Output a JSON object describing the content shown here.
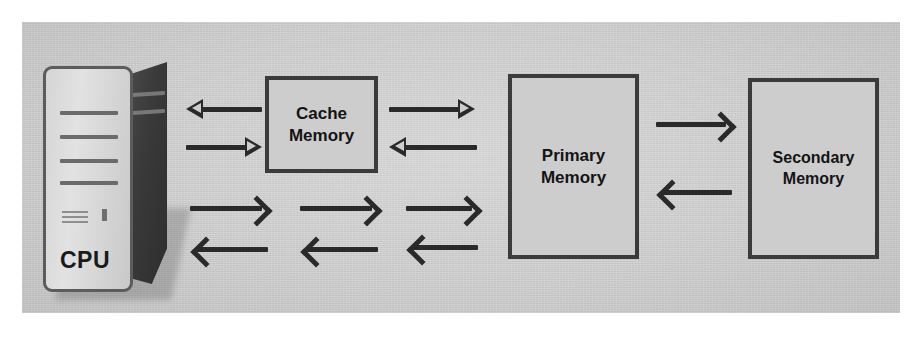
{
  "diagram": {
    "background_color": "#cfcfcf",
    "page_color": "#ffffff",
    "line_color": "#2a2a2a",
    "box_border_color": "#3b3b3b",
    "box_fill_color": "#cdcdcd"
  },
  "cpu": {
    "label": "CPU",
    "case_color": "#d5d5d5",
    "side_color": "#3a3a3a"
  },
  "boxes": [
    {
      "id": "cache",
      "line1": "Cache",
      "line2": "Memory"
    },
    {
      "id": "primary",
      "line1": "Primary",
      "line2": "Memory"
    },
    {
      "id": "secondary",
      "line1": "Secondary",
      "line2": "Memory"
    }
  ],
  "arrows": [
    {
      "id": "cache-to-cpu-upper",
      "from": "Cache Memory",
      "to": "CPU",
      "direction": "left",
      "style": "hollow-triangle"
    },
    {
      "id": "cpu-to-cache-upper",
      "from": "CPU",
      "to": "Cache Memory",
      "direction": "right",
      "style": "hollow-triangle"
    },
    {
      "id": "cache-to-primary-upper",
      "from": "Cache Memory",
      "to": "Primary Memory",
      "direction": "right",
      "style": "hollow-triangle"
    },
    {
      "id": "primary-to-cache-upper",
      "from": "Primary Memory",
      "to": "Cache Memory",
      "direction": "left",
      "style": "hollow-triangle"
    },
    {
      "id": "cpu-bus-out-1",
      "from": "CPU",
      "to": "bus",
      "direction": "right",
      "style": "chevron"
    },
    {
      "id": "cpu-bus-in-1",
      "from": "bus",
      "to": "CPU",
      "direction": "left",
      "style": "chevron"
    },
    {
      "id": "cpu-bus-out-2",
      "from": "bus",
      "to": "bus",
      "direction": "right",
      "style": "chevron"
    },
    {
      "id": "cpu-bus-in-2",
      "from": "bus",
      "to": "bus",
      "direction": "left",
      "style": "chevron"
    },
    {
      "id": "cpu-bus-out-3",
      "from": "bus",
      "to": "Primary Memory",
      "direction": "right",
      "style": "chevron"
    },
    {
      "id": "cpu-bus-in-3",
      "from": "Primary Memory",
      "to": "bus",
      "direction": "left",
      "style": "chevron"
    },
    {
      "id": "primary-to-secondary",
      "from": "Primary Memory",
      "to": "Secondary Memory",
      "direction": "right",
      "style": "chevron"
    },
    {
      "id": "secondary-to-primary",
      "from": "Secondary Memory",
      "to": "Primary Memory",
      "direction": "left",
      "style": "chevron"
    }
  ]
}
